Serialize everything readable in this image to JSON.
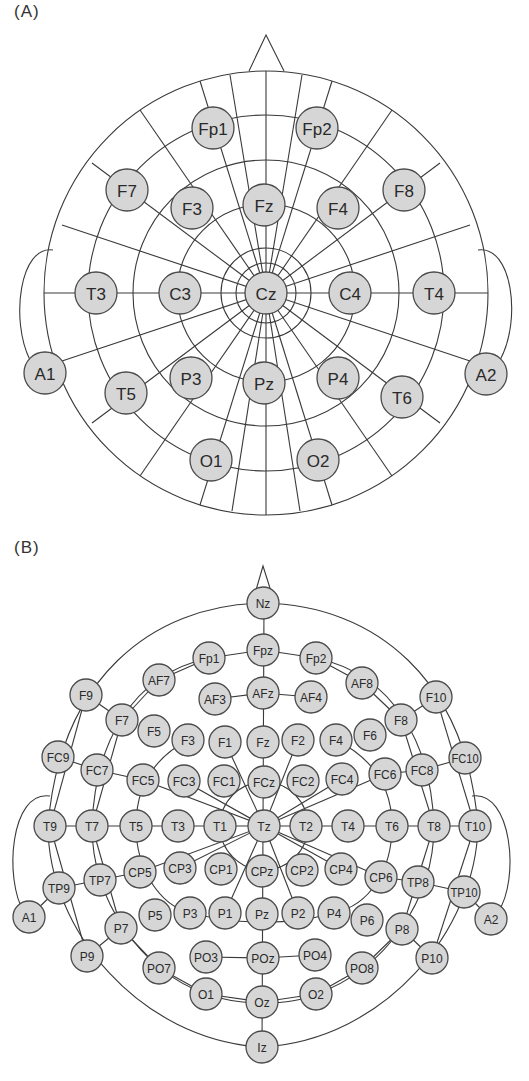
{
  "panels": [
    {
      "label": "(A)",
      "system": "10-20",
      "electrodes": [
        {
          "name": "Fp1",
          "x": 213,
          "y": 128
        },
        {
          "name": "Fp2",
          "x": 317,
          "y": 128
        },
        {
          "name": "F7",
          "x": 127,
          "y": 190
        },
        {
          "name": "F3",
          "x": 192,
          "y": 208
        },
        {
          "name": "Fz",
          "x": 264,
          "y": 205
        },
        {
          "name": "F4",
          "x": 338,
          "y": 208
        },
        {
          "name": "F8",
          "x": 404,
          "y": 190
        },
        {
          "name": "T3",
          "x": 96,
          "y": 293
        },
        {
          "name": "C3",
          "x": 180,
          "y": 293
        },
        {
          "name": "Cz",
          "x": 266,
          "y": 293
        },
        {
          "name": "C4",
          "x": 350,
          "y": 293
        },
        {
          "name": "T4",
          "x": 434,
          "y": 293
        },
        {
          "name": "A1",
          "x": 45,
          "y": 373
        },
        {
          "name": "A2",
          "x": 486,
          "y": 374
        },
        {
          "name": "T5",
          "x": 126,
          "y": 393
        },
        {
          "name": "P3",
          "x": 191,
          "y": 378
        },
        {
          "name": "Pz",
          "x": 264,
          "y": 383
        },
        {
          "name": "P4",
          "x": 338,
          "y": 378
        },
        {
          "name": "T6",
          "x": 402,
          "y": 397
        },
        {
          "name": "O1",
          "x": 211,
          "y": 460
        },
        {
          "name": "O2",
          "x": 318,
          "y": 460
        }
      ]
    },
    {
      "label": "(B)",
      "system": "10-10",
      "electrodes": [
        {
          "name": "Nz",
          "x": 263,
          "y": 603
        },
        {
          "name": "Fp1",
          "x": 209,
          "y": 658
        },
        {
          "name": "Fpz",
          "x": 263,
          "y": 650
        },
        {
          "name": "Fp2",
          "x": 316,
          "y": 658
        },
        {
          "name": "AF7",
          "x": 159,
          "y": 680
        },
        {
          "name": "AF3",
          "x": 215,
          "y": 699
        },
        {
          "name": "AFz",
          "x": 263,
          "y": 693
        },
        {
          "name": "AF4",
          "x": 311,
          "y": 697
        },
        {
          "name": "AF8",
          "x": 362,
          "y": 683
        },
        {
          "name": "F9",
          "x": 86,
          "y": 695
        },
        {
          "name": "F7",
          "x": 122,
          "y": 720
        },
        {
          "name": "F5",
          "x": 154,
          "y": 731
        },
        {
          "name": "F3",
          "x": 188,
          "y": 740
        },
        {
          "name": "F1",
          "x": 225,
          "y": 742
        },
        {
          "name": "Fz",
          "x": 263,
          "y": 742
        },
        {
          "name": "F2",
          "x": 298,
          "y": 740
        },
        {
          "name": "F4",
          "x": 336,
          "y": 740
        },
        {
          "name": "F6",
          "x": 370,
          "y": 735
        },
        {
          "name": "F8",
          "x": 401,
          "y": 720
        },
        {
          "name": "F10",
          "x": 436,
          "y": 697
        },
        {
          "name": "FC9",
          "x": 58,
          "y": 757
        },
        {
          "name": "FC7",
          "x": 97,
          "y": 770
        },
        {
          "name": "FC5",
          "x": 143,
          "y": 780
        },
        {
          "name": "FC3",
          "x": 184,
          "y": 781
        },
        {
          "name": "FC1",
          "x": 224,
          "y": 781
        },
        {
          "name": "FCz",
          "x": 264,
          "y": 782
        },
        {
          "name": "FC2",
          "x": 303,
          "y": 781
        },
        {
          "name": "FC4",
          "x": 342,
          "y": 779
        },
        {
          "name": "FC6",
          "x": 385,
          "y": 774
        },
        {
          "name": "FC8",
          "x": 422,
          "y": 770
        },
        {
          "name": "FC10",
          "x": 465,
          "y": 758
        },
        {
          "name": "T9",
          "x": 50,
          "y": 826
        },
        {
          "name": "T7",
          "x": 92,
          "y": 826
        },
        {
          "name": "T5",
          "x": 136,
          "y": 826
        },
        {
          "name": "T3",
          "x": 178,
          "y": 826
        },
        {
          "name": "T1",
          "x": 220,
          "y": 826
        },
        {
          "name": "Tz",
          "x": 264,
          "y": 826
        },
        {
          "name": "T2",
          "x": 306,
          "y": 826
        },
        {
          "name": "T4",
          "x": 348,
          "y": 826
        },
        {
          "name": "T6",
          "x": 392,
          "y": 826
        },
        {
          "name": "T8",
          "x": 434,
          "y": 826
        },
        {
          "name": "T10",
          "x": 475,
          "y": 826
        },
        {
          "name": "CP5",
          "x": 140,
          "y": 872
        },
        {
          "name": "CP3",
          "x": 180,
          "y": 868
        },
        {
          "name": "CP1",
          "x": 221,
          "y": 869
        },
        {
          "name": "CPz",
          "x": 262,
          "y": 871
        },
        {
          "name": "CP2",
          "x": 302,
          "y": 870
        },
        {
          "name": "CP4",
          "x": 341,
          "y": 869
        },
        {
          "name": "CP6",
          "x": 381,
          "y": 877
        },
        {
          "name": "TP7",
          "x": 100,
          "y": 880
        },
        {
          "name": "TP8",
          "x": 418,
          "y": 882
        },
        {
          "name": "TP9",
          "x": 59,
          "y": 888
        },
        {
          "name": "TP10",
          "x": 464,
          "y": 892
        },
        {
          "name": "A1",
          "x": 29,
          "y": 917
        },
        {
          "name": "A2",
          "x": 491,
          "y": 919
        },
        {
          "name": "P7",
          "x": 121,
          "y": 928
        },
        {
          "name": "P5",
          "x": 155,
          "y": 915
        },
        {
          "name": "P3",
          "x": 190,
          "y": 913
        },
        {
          "name": "P1",
          "x": 225,
          "y": 913
        },
        {
          "name": "Pz",
          "x": 262,
          "y": 914
        },
        {
          "name": "P2",
          "x": 298,
          "y": 913
        },
        {
          "name": "P4",
          "x": 334,
          "y": 913
        },
        {
          "name": "P6",
          "x": 367,
          "y": 920
        },
        {
          "name": "P8",
          "x": 402,
          "y": 929
        },
        {
          "name": "P9",
          "x": 87,
          "y": 956
        },
        {
          "name": "P10",
          "x": 432,
          "y": 958
        },
        {
          "name": "PO7",
          "x": 159,
          "y": 968
        },
        {
          "name": "PO3",
          "x": 206,
          "y": 957
        },
        {
          "name": "POz",
          "x": 263,
          "y": 958
        },
        {
          "name": "PO4",
          "x": 315,
          "y": 955
        },
        {
          "name": "PO8",
          "x": 362,
          "y": 968
        },
        {
          "name": "O1",
          "x": 206,
          "y": 994
        },
        {
          "name": "Oz",
          "x": 262,
          "y": 1002
        },
        {
          "name": "O2",
          "x": 316,
          "y": 994
        },
        {
          "name": "Iz",
          "x": 262,
          "y": 1047
        }
      ]
    }
  ]
}
